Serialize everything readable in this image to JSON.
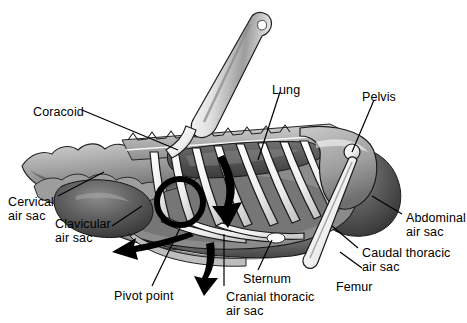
{
  "figure": {
    "background_color": "#ffffff",
    "ink_color": "#000000",
    "label_font_size_px": 12.5
  },
  "labels": {
    "coracoid": {
      "text": "Coracoid",
      "x": 33,
      "y": 106
    },
    "lung": {
      "text": "Lung",
      "x": 272,
      "y": 84
    },
    "pelvis": {
      "text": "Pelvis",
      "x": 362,
      "y": 91
    },
    "cervical": {
      "text": "Cervical\nair sac",
      "x": 8,
      "y": 195
    },
    "clavicular": {
      "text": "Clavicular\nair sac",
      "x": 55,
      "y": 217
    },
    "pivot_point": {
      "text": "Pivot point",
      "x": 114,
      "y": 290
    },
    "sternum": {
      "text": "Sternum",
      "x": 243,
      "y": 273
    },
    "cranial_thoracic": {
      "text": "Cranial thoracic\nair sac",
      "x": 226,
      "y": 290
    },
    "abdominal": {
      "text": "Abdominal\nair sac",
      "x": 406,
      "y": 211
    },
    "caudal_thoracic": {
      "text": "Caudal thoracic\nair sac",
      "x": 362,
      "y": 246
    },
    "femur": {
      "text": "Femur",
      "x": 336,
      "y": 281
    }
  },
  "annotations": {
    "spine_watermark": "",
    "arrows": [
      {
        "name": "sternum-swing-arrow",
        "direction": "left",
        "meaning": "sternum moves forward and down"
      },
      {
        "name": "rib-rotation-arrow",
        "direction": "down",
        "meaning": "rib rotation during inhalation"
      },
      {
        "name": "keel-descent-arrow",
        "direction": "down",
        "meaning": "keel descends"
      }
    ],
    "pivot_circle": {
      "name": "pivot-point-circle",
      "cx": 180,
      "cy": 202,
      "r": 24
    }
  },
  "colors": {
    "ink": "#000000",
    "bone_fill": "#ffffff",
    "bone_edge": "#202020",
    "tissue_light": "#b9b9b9",
    "tissue_mid": "#8e8e8e",
    "tissue_dark": "#5a5a5a",
    "tissue_darkest": "#333333",
    "background": "#ffffff"
  }
}
